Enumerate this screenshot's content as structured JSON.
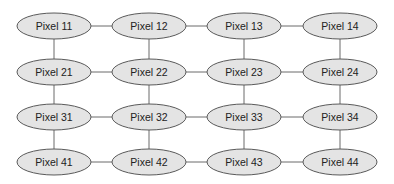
{
  "diagram": {
    "type": "grid-graph",
    "colors": {
      "node_fill": "#e4e4e4",
      "node_stroke": "#5a5a5a",
      "edge": "#6a6a6a",
      "text": "#222222",
      "background": "#ffffff"
    },
    "columns_x": [
      54,
      149,
      244,
      340
    ],
    "rows_y": [
      26,
      72,
      117,
      162
    ],
    "node_rx": 37,
    "node_ry": 13,
    "rows": [
      {
        "nodes": [
          {
            "label": "Pixel 11"
          },
          {
            "label": "Pixel 12"
          },
          {
            "label": "Pixel 13"
          },
          {
            "label": "Pixel 14"
          }
        ]
      },
      {
        "nodes": [
          {
            "label": "Pixel 21"
          },
          {
            "label": "Pixel 22"
          },
          {
            "label": "Pixel 23"
          },
          {
            "label": "Pixel 24"
          }
        ]
      },
      {
        "nodes": [
          {
            "label": "Pixel 31"
          },
          {
            "label": "Pixel 32"
          },
          {
            "label": "Pixel 33"
          },
          {
            "label": "Pixel 34"
          }
        ]
      },
      {
        "nodes": [
          {
            "label": "Pixel 41"
          },
          {
            "label": "Pixel 42"
          },
          {
            "label": "Pixel 43"
          },
          {
            "label": "Pixel 44"
          }
        ]
      }
    ]
  }
}
